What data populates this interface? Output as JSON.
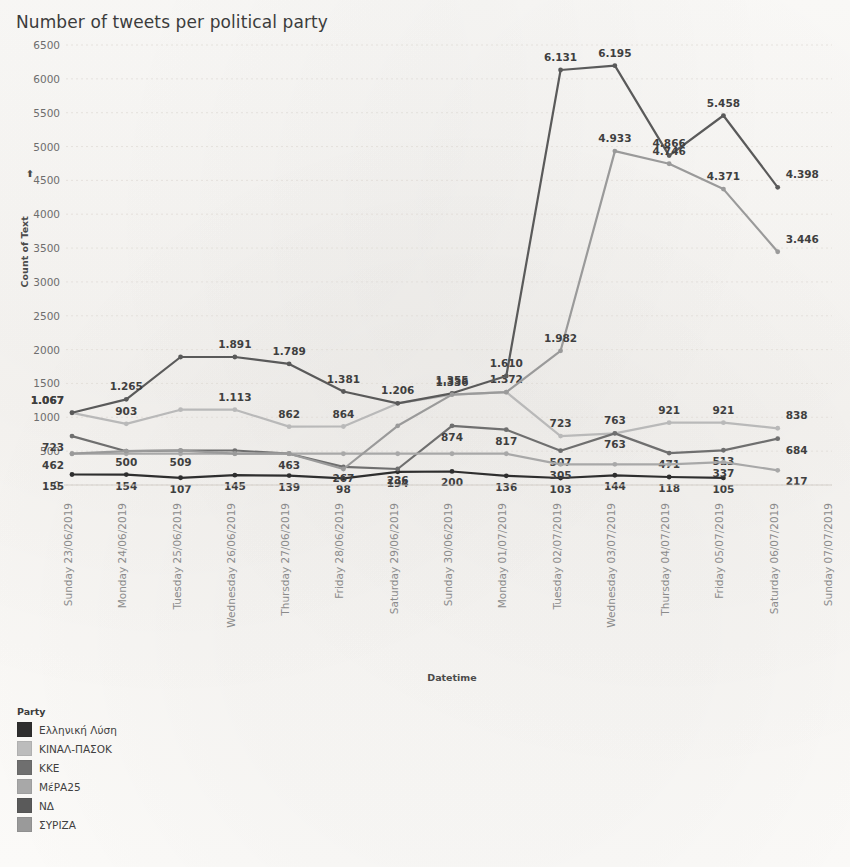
{
  "chart_data": {
    "type": "line",
    "title": "Number of tweets per political party",
    "xlabel": "Datetime",
    "ylabel": "Count of Text",
    "ylim": [
      0,
      6500
    ],
    "ytick_step": 500,
    "yticks": [
      0,
      500,
      1000,
      1500,
      2000,
      2500,
      3000,
      3500,
      4000,
      4500,
      5000,
      5500,
      6000,
      6500
    ],
    "grid": true,
    "legend_position": "bottom-left",
    "legend_title": "Party",
    "categories": [
      "Sunday 23/06/2019",
      "Monday 24/06/2019",
      "Tuesday 25/06/2019",
      "Wednesday 26/06/2019",
      "Thursday 27/06/2019",
      "Friday 28/06/2019",
      "Saturday 29/06/2019",
      "Sunday 30/06/2019",
      "Monday 01/07/2019",
      "Tuesday 02/07/2019",
      "Wednesday 03/07/2019",
      "Thursday 04/07/2019",
      "Friday 05/07/2019",
      "Saturday 06/07/2019",
      "Sunday 07/07/2019"
    ],
    "series": [
      {
        "name": "Ελληνική Λύση",
        "color": "#2e2e2e",
        "values": [
          155,
          154,
          107,
          145,
          139,
          98,
          194,
          200,
          136,
          103,
          144,
          118,
          105,
          null,
          null
        ],
        "labels": [
          "155",
          "154",
          "107",
          "145",
          "139",
          "98",
          "194",
          "200",
          "136",
          "103",
          "144",
          "118",
          "105",
          "",
          ""
        ]
      },
      {
        "name": "ΚΙΝΑΛ-ΠΑΣΟΚ",
        "color": "#b9b9b9",
        "values": [
          1067,
          903,
          1113,
          1113,
          862,
          864,
          1206,
          1336,
          1372,
          723,
          763,
          921,
          921,
          838,
          null
        ],
        "labels": [
          "1.067",
          "903",
          "",
          "1.113",
          "862",
          "864",
          "1.206",
          "1.336",
          "1.372",
          "723",
          "763",
          "921",
          "921",
          "838",
          ""
        ]
      },
      {
        "name": "ΚΚΕ",
        "color": "#6f6f6f",
        "values": [
          723,
          500,
          509,
          509,
          463,
          267,
          236,
          874,
          817,
          507,
          763,
          471,
          513,
          684,
          null
        ],
        "labels": [
          "723",
          "500",
          "509",
          "",
          "463",
          "267",
          "236",
          "874",
          "817",
          "507",
          "763",
          "471",
          "513",
          "684",
          ""
        ]
      },
      {
        "name": "ΜέΡΑΙΙΙΙΙ",
        "color": "#a8a8a8",
        "values": [
          462,
          462,
          462,
          462,
          462,
          462,
          462,
          462,
          462,
          305,
          305,
          305,
          337,
          217,
          null
        ],
        "labels": [
          "462",
          "",
          "",
          "",
          "",
          "",
          "",
          "",
          "",
          "305",
          "",
          "",
          "337",
          "217",
          ""
        ]
      },
      {
        "name": "ΝΔ",
        "color": "#5a5a5a",
        "values": [
          1067,
          1265,
          1891,
          1891,
          1789,
          1381,
          1206,
          1355,
          1610,
          6131,
          6195,
          4866,
          5458,
          4398,
          null
        ],
        "labels": [
          "1.067",
          "1.265",
          "",
          "1.891",
          "1.789",
          "1.381",
          "",
          "1.355",
          "1.610",
          "6.131",
          "6.195",
          "4.866",
          "5.458",
          "4.398",
          ""
        ]
      },
      {
        "name": "ΣΥΡΙΖΑ",
        "color": "#9a9a9a",
        "values": [
          462,
          500,
          509,
          463,
          463,
          236,
          874,
          1336,
          1372,
          1982,
          4933,
          4746,
          4371,
          3446,
          null
        ],
        "labels": [
          "",
          "",
          "",
          "",
          "",
          "",
          "",
          "",
          "",
          "1.982",
          "4.933",
          "4.746",
          "4.371",
          "3.446",
          ""
        ]
      }
    ]
  },
  "legend": {
    "title": "Party",
    "items": [
      {
        "label": "Ελληνική Λύση",
        "color": "#2e2e2e"
      },
      {
        "label": "ΚΙΝΑΛ-ΠΑΣΟΚ",
        "color": "#bcbcbc"
      },
      {
        "label": "ΚΚΕ",
        "color": "#6f6f6f"
      },
      {
        "label": "ΜέΡΑ25",
        "color": "#a8a8a8"
      },
      {
        "label": "ΝΔ",
        "color": "#5a5a5a"
      },
      {
        "label": "ΣΥΡΙΖΑ",
        "color": "#9a9a9a"
      }
    ]
  },
  "axes": {
    "y_title": "Count of Text",
    "x_title": "Datetime",
    "sort_indicator": "sort-arrow-icon"
  },
  "plot_points": {
    "nd": [
      {
        "x": "Sunday 23/06/2019",
        "y": 1067,
        "label": "1.067"
      },
      {
        "x": "Monday 24/06/2019",
        "y": 1265,
        "label": "1.265"
      },
      {
        "x": "Wednesday 26/06/2019",
        "y": 1891,
        "label": "1.891"
      },
      {
        "x": "Thursday 27/06/2019",
        "y": 1789,
        "label": "1.789"
      },
      {
        "x": "Friday 28/06/2019",
        "y": 1381,
        "label": "1.381"
      },
      {
        "x": "Saturday 29/06/2019",
        "y": 1206,
        "label": "1.206"
      },
      {
        "x": "Sunday 30/06/2019",
        "y": 1355,
        "label": "1.355"
      },
      {
        "x": "Monday 01/07/2019",
        "y": 1610,
        "label": "1.610"
      },
      {
        "x": "Tuesday 02/07/2019",
        "y": 6131,
        "label": "6.131"
      },
      {
        "x": "Wednesday 03/07/2019",
        "y": 6195,
        "label": "6.195"
      },
      {
        "x": "Thursday 04/07/2019",
        "y": 4866,
        "label": "4.866"
      },
      {
        "x": "Friday 05/07/2019",
        "y": 5458,
        "label": "5.458"
      },
      {
        "x": "Saturday 06/07/2019",
        "y": 4398,
        "label": "4.398"
      }
    ],
    "syriza": [
      {
        "x": "Tuesday 02/07/2019",
        "y": 1982,
        "label": "1.982"
      },
      {
        "x": "Wednesday 03/07/2019",
        "y": 4933,
        "label": "4.933"
      },
      {
        "x": "Thursday 04/07/2019",
        "y": 4746,
        "label": "4.746"
      },
      {
        "x": "Friday 05/07/2019",
        "y": 4371,
        "label": "4.371"
      },
      {
        "x": "Saturday 06/07/2019",
        "y": 3446,
        "label": "3.446"
      }
    ]
  }
}
